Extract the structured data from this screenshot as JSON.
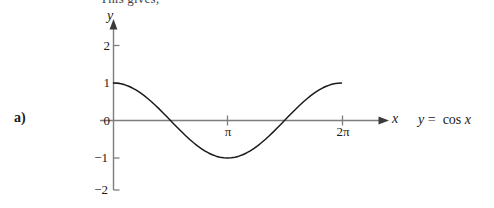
{
  "caption": {
    "text": "This gives;"
  },
  "part_label": "a)",
  "equation": {
    "lhs": "y",
    "operator": "=",
    "rhs": "cos x"
  },
  "chart_data": {
    "type": "line",
    "title": "",
    "xlabel": "x",
    "ylabel": "y",
    "function": "y = cos x",
    "xlim": [
      0,
      6.7858
    ],
    "ylim": [
      -2.35,
      2.5
    ],
    "grid": false,
    "legend": null,
    "x_ticks": [
      {
        "value": 3.14159,
        "label": "π"
      },
      {
        "value": 6.28318,
        "label": "2π"
      }
    ],
    "y_ticks": [
      {
        "value": 2,
        "label": "2"
      },
      {
        "value": 1,
        "label": "1"
      },
      {
        "value": 0,
        "label": "0"
      },
      {
        "value": -1,
        "label": "−1"
      },
      {
        "value": -2,
        "label": "−2"
      }
    ],
    "axis_arrows": {
      "x": true,
      "y": true
    },
    "series": [
      {
        "name": "y = cos x",
        "color": "#1a1a1a",
        "x": [
          0.0,
          0.1047,
          0.2094,
          0.3142,
          0.4189,
          0.5236,
          0.6283,
          0.733,
          0.8378,
          0.9425,
          1.0472,
          1.1519,
          1.2566,
          1.3614,
          1.4661,
          1.5708,
          1.6755,
          1.7802,
          1.885,
          1.9897,
          2.0944,
          2.1991,
          2.3038,
          2.4086,
          2.5133,
          2.618,
          2.7227,
          2.8274,
          2.9322,
          3.0369,
          3.1416,
          3.2463,
          3.351,
          3.4558,
          3.5605,
          3.6652,
          3.7699,
          3.8746,
          3.9794,
          4.0841,
          4.1888,
          4.2935,
          4.3982,
          4.5029,
          4.6077,
          4.7124,
          4.8171,
          4.9218,
          5.0265,
          5.1313,
          5.236,
          5.3407,
          5.4454,
          5.5501,
          5.6549,
          5.7596,
          5.8643,
          5.969,
          6.0737,
          6.1785,
          6.2832
        ],
        "y": [
          1.0,
          0.9945,
          0.9781,
          0.9511,
          0.9135,
          0.866,
          0.809,
          0.7431,
          0.6691,
          0.5878,
          0.5,
          0.4067,
          0.309,
          0.2079,
          0.1045,
          0.0,
          -0.1045,
          -0.2079,
          -0.309,
          -0.4067,
          -0.5,
          -0.5878,
          -0.6691,
          -0.7431,
          -0.809,
          -0.866,
          -0.9135,
          -0.9511,
          -0.9781,
          -0.9945,
          -1.0,
          -0.9945,
          -0.9781,
          -0.9511,
          -0.9135,
          -0.866,
          -0.809,
          -0.7431,
          -0.6691,
          -0.5878,
          -0.5,
          -0.4067,
          -0.309,
          -0.2079,
          -0.1045,
          0.0,
          0.1045,
          0.2079,
          0.309,
          0.4067,
          0.5,
          0.5878,
          0.6691,
          0.7431,
          0.809,
          0.866,
          0.9135,
          0.9511,
          0.9781,
          0.9945,
          1.0
        ]
      }
    ],
    "zero_crossings": [
      1.5708,
      4.7124
    ],
    "minimum": {
      "x": 3.14159,
      "y": -1
    },
    "maxima": [
      {
        "x": 0,
        "y": 1
      },
      {
        "x": 6.28318,
        "y": 1
      }
    ]
  },
  "icons": {
    "x_axis_arrow": "arrow-right-icon",
    "y_axis_arrow": "arrow-up-icon"
  },
  "colors": {
    "background": "#ffffff",
    "curve": "#1a1a1a",
    "axis": "#777777",
    "text": "#1a1a1a"
  }
}
